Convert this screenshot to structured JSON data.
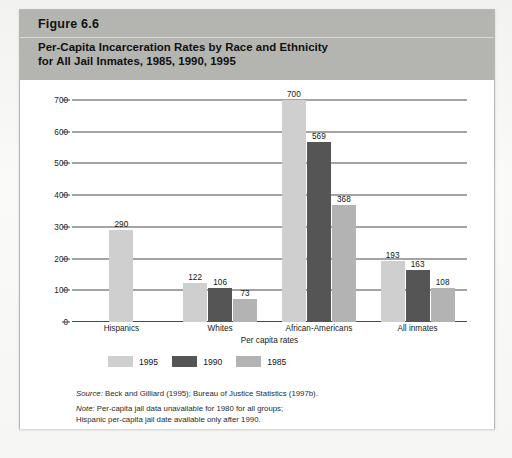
{
  "figure": {
    "number": "Figure 6.6",
    "title_line1": "Per-Capita Incarceration Rates by Race and Ethnicity",
    "title_line2": "for All Jail Inmates, 1985, 1990, 1995"
  },
  "notes": {
    "source_key": "Source:",
    "source_text": " Beck and Gilliard (1995); Bureau of Justice Statistics (1997b).",
    "note_key": "Note:",
    "note_text": " Per-capita jail data unavailable for 1980 for all groups;",
    "note_line2": "Hispanic per-capita jail date available only after 1990."
  },
  "chart_data": {
    "type": "bar",
    "title": "Per-Capita Incarceration Rates by Race and Ethnicity for All Jail Inmates, 1985, 1990, 1995",
    "xlabel": "Per capita rates",
    "ylabel": "",
    "ylim": [
      0,
      700
    ],
    "yticks": [
      0,
      100,
      200,
      300,
      400,
      500,
      600,
      700
    ],
    "ytick_labels": [
      "0",
      "100",
      "200",
      "300",
      "400",
      "500",
      "600",
      "700"
    ],
    "grid": true,
    "legend_position": "bottom-left",
    "categories": [
      "Hispanics",
      "Whites",
      "African-Americans",
      "All inmates"
    ],
    "series": [
      {
        "name": "1995",
        "color": "#cfcfcf",
        "values": [
          290,
          122,
          700,
          193
        ],
        "labels": [
          "290",
          "122",
          "700",
          "193"
        ]
      },
      {
        "name": "1990",
        "color": "#555555",
        "values": [
          null,
          106,
          569,
          163
        ],
        "labels": [
          "",
          "106",
          "569",
          "163"
        ]
      },
      {
        "name": "1985",
        "color": "#b3b3b3",
        "values": [
          null,
          73,
          368,
          108
        ],
        "labels": [
          "",
          "73",
          "368",
          "108"
        ]
      }
    ]
  }
}
